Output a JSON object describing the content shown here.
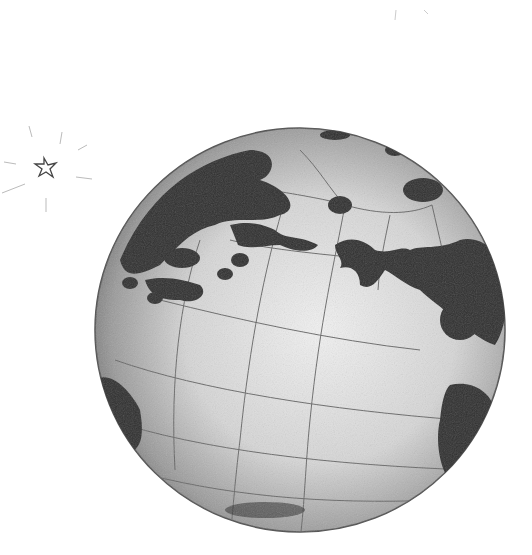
{
  "image": {
    "subject": "pencil sketch of a globe",
    "background_color": "#ffffff",
    "globe": {
      "cx": 300,
      "cy": 328,
      "r": 205,
      "ocean_color": "#d8d8d8",
      "land_color": "#2e2e2e",
      "outline_color": "#555555"
    },
    "star": {
      "cx": 47,
      "cy": 168,
      "size": 12,
      "color": "#444444"
    }
  }
}
